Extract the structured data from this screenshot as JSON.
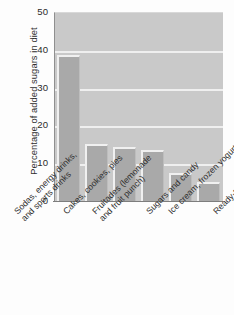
{
  "chart_data": {
    "type": "bar",
    "title": "",
    "xlabel": "",
    "ylabel": "Percentage of added sugars in diet",
    "ylim": [
      0,
      50
    ],
    "yticks": [
      0,
      10,
      20,
      30,
      40,
      50
    ],
    "grid": true,
    "legend": false,
    "categories": [
      "Sodas, energy drinks, and sports drinks",
      "Cakes, cookies, pies",
      "Fruitades (lemonade and fruit punch)",
      "Sugars and candy",
      "Ice cream, frozen yogurt",
      "Ready-to-eat cereals"
    ],
    "values": [
      38.5,
      15,
      14.2,
      13.5,
      7.5,
      5
    ]
  },
  "axes": {
    "y_title": "Percentage of added sugars in diet",
    "tick_labels": [
      "50",
      "40",
      "30",
      "20",
      "10",
      "0"
    ],
    "category_labels": [
      {
        "line1": "Sodas, energy drinks,",
        "line2": "and sports drinks"
      },
      {
        "line1": "Cakes, cookies, pies",
        "line2": ""
      },
      {
        "line1": "Fruitades (lemonade",
        "line2": "and fruit punch)"
      },
      {
        "line1": "Sugars and candy",
        "line2": ""
      },
      {
        "line1": "Ice cream, frozen yogurt",
        "line2": ""
      },
      {
        "line1": "Ready-to-eat cereals",
        "line2": ""
      }
    ]
  },
  "colors": {
    "bar_fill": "#a9a9a9",
    "plot_background": "#c9c9c9",
    "gridline": "#efefef",
    "page_background": "#fdfdfd",
    "text": "#2e2e2e"
  }
}
